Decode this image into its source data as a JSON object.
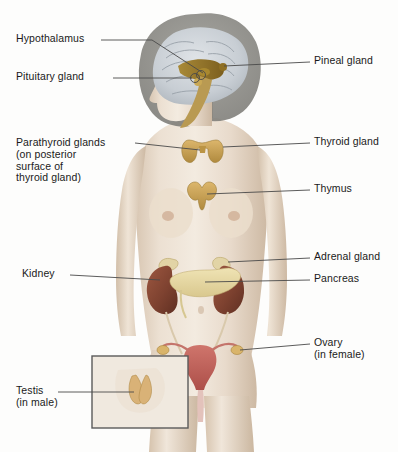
{
  "figure": {
    "background_color": "#fdfdfc",
    "width": 398,
    "height": 452
  },
  "labels": {
    "hypothalamus": "Hypothalamus",
    "pituitary_gland": "Pituitary gland",
    "parathyroid_glands": "Parathyroid glands\n(on posterior\nsurface of\nthyroid gland)",
    "kidney": "Kidney",
    "testis": "Testis\n(in male)",
    "pineal_gland": "Pineal gland",
    "thyroid_gland": "Thyroid gland",
    "thymus": "Thymus",
    "adrenal_gland": "Adrenal gland",
    "pancreas": "Pancreas",
    "ovary": "Ovary\n(in female)"
  },
  "colors": {
    "leader_line": "#4a4a4a",
    "label_text": "#1a1a1a",
    "skin_light": "#efe4d8",
    "skin_mid": "#e0d0be",
    "skin_shadow": "#cbb8a2",
    "hair": "#8e8d88",
    "brain_gray": "#c9cdd2",
    "brainstem_gold": "#9a7a2e",
    "gland_gold": "#c8a255",
    "kidney_brown": "#8a4a33",
    "pancreas_cream": "#e6d9a8",
    "uterus_pink": "#c4645e",
    "inset_border": "#5a5a5a"
  },
  "inset": {
    "name": "testis-inset",
    "border_color": "#5a5a5a"
  },
  "markers": {
    "hypothalamus_dot": "circle-marker",
    "pituitary_dot": "circle-marker"
  }
}
